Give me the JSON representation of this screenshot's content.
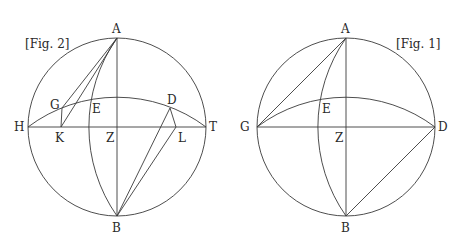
{
  "figures": [
    {
      "id": "fig2",
      "caption": "[Fig. 2]",
      "labels": {
        "A": "A",
        "B": "B",
        "G": "G",
        "E": "E",
        "D": "D",
        "H": "H",
        "K": "K",
        "Z": "Z",
        "L": "L",
        "T": "T"
      }
    },
    {
      "id": "fig1",
      "caption": "[Fig. 1]",
      "labels": {
        "A": "A",
        "B": "B",
        "E": "E",
        "G": "G",
        "Z": "Z",
        "D": "D"
      }
    }
  ],
  "colors": {
    "stroke": "#3a3a3a",
    "text": "#2a2a2a",
    "background": "#ffffff"
  }
}
